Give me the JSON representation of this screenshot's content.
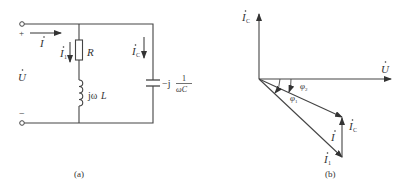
{
  "figure_a": {
    "caption": "(a)",
    "plus_sign": "+",
    "minus_sign": "−",
    "voltage_label": "U",
    "current_total_label": "I",
    "current_branch1_label": "I",
    "current_branch1_sub": "1",
    "current_cap_label": "I",
    "current_cap_sub": "C",
    "resistor_label": "R",
    "inductor_label_prefix": "jω",
    "inductor_label_var": "L",
    "capacitor_label_prefix": "−j",
    "capacitor_fraction_num": "1",
    "capacitor_fraction_den": "ωC"
  },
  "figure_b": {
    "caption": "(b)",
    "axis_voltage_label": "U",
    "axis_ic_label": "I",
    "axis_ic_sub": "C",
    "phi1_label": "φ",
    "phi1_sub": "1",
    "phi2_label": "φ",
    "phi2_sub": "2",
    "vec_I_label": "I",
    "vec_I1_label": "I",
    "vec_I1_sub": "1",
    "vec_Ic_label": "I",
    "vec_Ic_sub": "C"
  },
  "colors": {
    "line": "#444444",
    "text": "#333333",
    "background": "#ffffff"
  }
}
